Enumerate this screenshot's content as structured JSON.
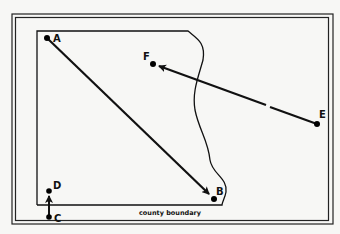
{
  "diagram": {
    "caption": "county boundary",
    "colors": {
      "ink": "#111111",
      "paper": "#f7f7f5"
    },
    "points": [
      {
        "id": "A",
        "label": "A",
        "x": 47,
        "y": 38
      },
      {
        "id": "B",
        "label": "B",
        "x": 214,
        "y": 199
      },
      {
        "id": "C",
        "label": "C",
        "x": 49,
        "y": 217
      },
      {
        "id": "D",
        "label": "D",
        "x": 49,
        "y": 191
      },
      {
        "id": "E",
        "label": "E",
        "x": 317,
        "y": 124
      },
      {
        "id": "F",
        "label": "F",
        "x": 153,
        "y": 64
      }
    ],
    "arrows": [
      {
        "from": "A",
        "to": "B"
      },
      {
        "from": "C",
        "to": "D"
      },
      {
        "from": "E",
        "to": "F",
        "broken": true
      }
    ]
  }
}
